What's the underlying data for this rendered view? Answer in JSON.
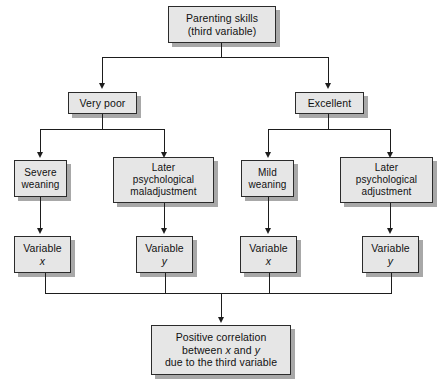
{
  "diagram": {
    "type": "flowchart",
    "colors": {
      "node_fill": "#e6e6e6",
      "node_border": "#2b2b2b",
      "node_shadow": "#a8a8a8",
      "connector": "#1d1d1d",
      "background": "#ffffff"
    },
    "nodes": {
      "root": {
        "line1": "Parenting skills",
        "line2": "(third variable)"
      },
      "branch_left": {
        "label": "Very poor"
      },
      "branch_right": {
        "label": "Excellent"
      },
      "outcome_1": {
        "line1": "Severe",
        "line2": "weaning"
      },
      "outcome_2": {
        "line1": "Later",
        "line2": "psychological",
        "line3": "maladjustment"
      },
      "outcome_3": {
        "line1": "Mild",
        "line2": "weaning"
      },
      "outcome_4": {
        "line1": "Later",
        "line2": "psychological",
        "line3": "adjustment"
      },
      "variable_1": {
        "line1": "Variable",
        "symbol": "x"
      },
      "variable_2": {
        "line1": "Variable",
        "symbol": "y"
      },
      "variable_3": {
        "line1": "Variable",
        "symbol": "x"
      },
      "variable_4": {
        "line1": "Variable",
        "symbol": "y"
      },
      "conclusion": {
        "line1": "Positive correlation",
        "line2_pre": "between ",
        "line2_x": "x",
        "line2_mid": " and ",
        "line2_y": "y",
        "line3": "due to the third variable"
      }
    }
  }
}
